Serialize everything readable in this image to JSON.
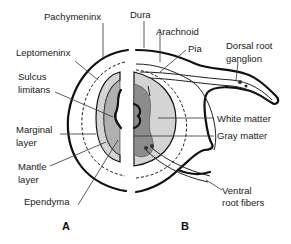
{
  "figure": {
    "panels": [
      {
        "id": "A",
        "label": "A"
      },
      {
        "id": "B",
        "label": "B"
      }
    ],
    "labels_left": {
      "pachymeninx": "Pachymeninx",
      "leptomeninx": "Leptomeninx",
      "sulcus_limitans_1": "Sulcus",
      "sulcus_limitans_2": "limitans",
      "marginal_layer_1": "Marginal",
      "marginal_layer_2": "layer",
      "mantle_layer_1": "Mantle",
      "mantle_layer_2": "layer",
      "ependyma": "Ependyma"
    },
    "labels_right": {
      "dura": "Dura",
      "arachnoid": "Arachnoid",
      "pia": "Pia",
      "dorsal_root_ganglion_1": "Dorsal root",
      "dorsal_root_ganglion_2": "ganglion",
      "white_matter": "White matter",
      "gray_matter": "Gray matter",
      "ventral_root_fibers_1": "Ventral",
      "ventral_root_fibers_2": "root fibers"
    },
    "colors": {
      "light_gray": "#d4d4d4",
      "mid_gray": "#b0b0b0",
      "dark_gray": "#8c8c8c",
      "line": "#111111"
    }
  }
}
